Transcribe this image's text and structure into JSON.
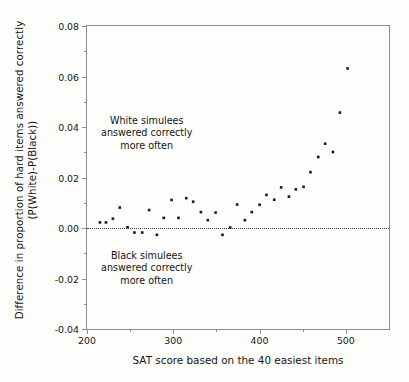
{
  "chart_data": {
    "type": "scatter",
    "title": "",
    "xlabel": "SAT score based on the 40 easiest items",
    "ylabel_line1": "Difference in proportion of hard items answered correctly",
    "ylabel_line2": "(P(White)-P(Black))",
    "xlim": [
      200,
      550
    ],
    "ylim": [
      -0.04,
      0.08
    ],
    "grid": false,
    "legend": null,
    "x_major_ticks": [
      200,
      300,
      400,
      500
    ],
    "x_minor_ticks": [
      250,
      350,
      450
    ],
    "x_tick_labels": [
      "200",
      "300",
      "400",
      "500"
    ],
    "y_major_ticks": [
      -0.04,
      -0.02,
      0.0,
      0.02,
      0.04,
      0.06,
      0.08
    ],
    "y_minor_ticks": [
      -0.03,
      -0.01,
      0.01,
      0.03,
      0.05,
      0.07
    ],
    "y_tick_labels": [
      "-0.04",
      "-0.02",
      "0.00",
      "0.02",
      "0.04",
      "0.06",
      "0.08"
    ],
    "reference_lines": [
      {
        "axis": "y",
        "value": 0.0,
        "style": "dotted"
      }
    ],
    "marker": {
      "shape": "square",
      "size": 2.6,
      "color": "#1a1a1a"
    },
    "annotations": [
      {
        "id": "white-note",
        "lines": [
          "White simulees",
          "answered correctly",
          "more often"
        ],
        "x": 258,
        "y": 0.0345
      },
      {
        "id": "black-note",
        "lines": [
          "Black simulees",
          "answered correctly",
          "more often"
        ],
        "x": 258,
        "y": -0.0185
      }
    ],
    "x": [
      215,
      222,
      230,
      238,
      247,
      255,
      264,
      272,
      281,
      289,
      298,
      306,
      315,
      323,
      332,
      340,
      349,
      357,
      366,
      374,
      383,
      391,
      400,
      408,
      417,
      425,
      434,
      442,
      451,
      459,
      468,
      476,
      485,
      493,
      502
    ],
    "y": [
      0.0022,
      0.0022,
      0.0037,
      0.0081,
      0.0003,
      -0.0018,
      -0.0018,
      0.0071,
      -0.0027,
      0.004,
      0.0111,
      0.004,
      0.0118,
      0.0104,
      0.0063,
      0.0031,
      0.0061,
      -0.0027,
      0.0002,
      0.0093,
      0.0031,
      0.0063,
      0.0092,
      0.0131,
      0.0112,
      0.0161,
      0.0124,
      0.0153,
      0.0163,
      0.0221,
      0.0281,
      0.0334,
      0.0301,
      0.0457,
      0.0632
    ]
  }
}
